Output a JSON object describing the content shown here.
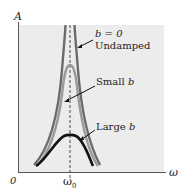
{
  "diagram": {
    "y_axis_label": "A",
    "x_axis_label": "ω",
    "origin_label": "0",
    "resonance_label": "ω",
    "resonance_subscript": "0",
    "curves": [
      {
        "name": "undamped",
        "label_line1": "b = 0",
        "label_line2": "Undamped",
        "color": "#6b6b6b"
      },
      {
        "name": "small-b",
        "label_line1": "Small ",
        "label_var": "b",
        "color": "#9a9a9a"
      },
      {
        "name": "large-b",
        "label_line1": "Large ",
        "label_var": "b",
        "color": "#111111"
      }
    ],
    "colors": {
      "plot_background": "#ececec",
      "axis": "#555555",
      "dashed_line": "#333333"
    }
  }
}
